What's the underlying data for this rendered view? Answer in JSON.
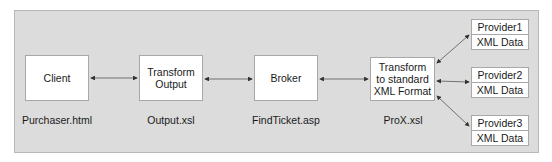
{
  "diagram": {
    "nodes": [
      {
        "id": "client",
        "label": "Client",
        "caption": "Purchaser.html"
      },
      {
        "id": "transform-output",
        "label_lines": [
          "Transform",
          "Output"
        ],
        "caption": "Output.xsl"
      },
      {
        "id": "broker",
        "label": "Broker",
        "caption": "FindTicket.asp"
      },
      {
        "id": "transform-standard",
        "label_lines": [
          "Transform",
          "to standard",
          "XML Format"
        ],
        "caption": "ProX.xsl"
      }
    ],
    "providers": [
      {
        "id": "provider1",
        "name": "Provider1",
        "data": "XML Data"
      },
      {
        "id": "provider2",
        "name": "Provider2",
        "data": "XML Data"
      },
      {
        "id": "provider3",
        "name": "Provider3",
        "data": "XML Data"
      }
    ],
    "edges": [
      {
        "from": "client",
        "to": "transform-output",
        "bidirectional": true
      },
      {
        "from": "transform-output",
        "to": "broker",
        "bidirectional": true
      },
      {
        "from": "broker",
        "to": "transform-standard",
        "bidirectional": true
      },
      {
        "from": "transform-standard",
        "to": "provider1",
        "bidirectional": true
      },
      {
        "from": "transform-standard",
        "to": "provider2",
        "bidirectional": true
      },
      {
        "from": "transform-standard",
        "to": "provider3",
        "bidirectional": true
      }
    ],
    "colors": {
      "panel": "#dcdcdc",
      "box": "#ffffff",
      "border": "#a8a8a8",
      "arrow": "#333333"
    }
  }
}
